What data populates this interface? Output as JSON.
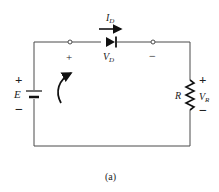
{
  "figure": {
    "caption": "(a)",
    "type": "series diode circuit"
  },
  "colors": {
    "wire": "#4a4a4a",
    "component": "#111111",
    "text": "#222222"
  },
  "source": {
    "label": "E",
    "plus": "+",
    "minus": "−",
    "icon": "battery-icon"
  },
  "diode": {
    "current_label": "I",
    "current_sub": "D",
    "voltage_label": "V",
    "voltage_sub": "D",
    "plus": "+",
    "minus": "−",
    "icon": "diode-icon"
  },
  "resistor": {
    "label": "R",
    "voltage_label": "V",
    "voltage_sub": "R",
    "plus": "+",
    "minus": "−",
    "icon": "resistor-icon"
  },
  "loop": {
    "icon": "curved-arrow-icon",
    "direction": "clockwise"
  }
}
